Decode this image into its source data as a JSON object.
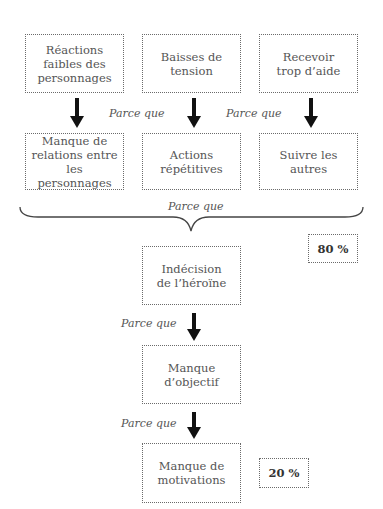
{
  "diagram": {
    "type": "cause-effect flowchart",
    "row1": [
      {
        "label": "Réactions faibles des personnages"
      },
      {
        "label": "Baisses de tension"
      },
      {
        "label": "Recevoir trop d’aide"
      }
    ],
    "row2": [
      {
        "label": "Manque de relations entre les personnages"
      },
      {
        "label": "Actions répétitives"
      },
      {
        "label": "Suivre les autres"
      }
    ],
    "connector_label": "Parce que",
    "chain": [
      {
        "label": "Indécision de l’héroïne"
      },
      {
        "label": "Manque d’objectif"
      },
      {
        "label": "Manque de motivations"
      }
    ],
    "percent_top": "80 %",
    "percent_bottom": "20 %"
  }
}
